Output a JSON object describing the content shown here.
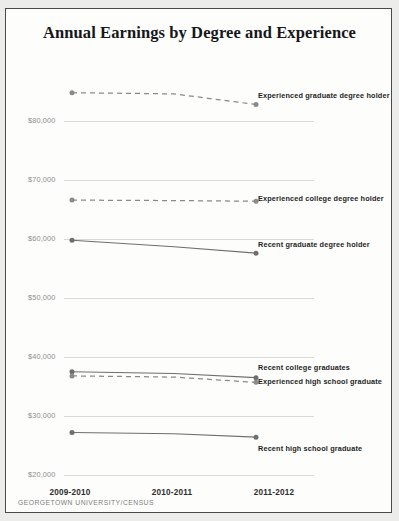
{
  "chart": {
    "title": "Annual Earnings by Degree and Experience",
    "source_note": "GEORGETOWN UNIVERSITY/CENSUS"
  },
  "chart_data": {
    "type": "line",
    "title": "Annual Earnings by Degree and Experience",
    "xlabel": "",
    "ylabel": "",
    "categories": [
      "2009-2010",
      "2010-2011",
      "2011-2012"
    ],
    "ylim": [
      20000,
      80000
    ],
    "yticks": [
      "$20,000",
      "$30,000",
      "$40,000",
      "$50,000",
      "$60,000",
      "$70,000",
      "$80,000"
    ],
    "ytick_values": [
      20000,
      30000,
      40000,
      50000,
      60000,
      70000,
      80000
    ],
    "grid": true,
    "legend_position": "right-inline",
    "series": [
      {
        "name": "Experienced graduate degree holder",
        "style": "dashed",
        "color": "#8a8a8a",
        "values": [
          84800,
          84600,
          82800
        ],
        "label_y": 86
      },
      {
        "name": "Experienced college degree holder",
        "style": "dashed",
        "color": "#8a8a8a",
        "values": [
          66600,
          66500,
          66400
        ],
        "label_y": 189
      },
      {
        "name": "Recent graduate degree holder",
        "style": "solid",
        "color": "#6e6e6e",
        "values": [
          59800,
          58700,
          57600
        ],
        "label_y": 235
      },
      {
        "name": "Recent college graduates",
        "style": "solid",
        "color": "#6e6e6e",
        "values": [
          37500,
          37200,
          36500
        ],
        "label_y": 358
      },
      {
        "name": "Experienced high school graduate",
        "style": "dashed",
        "color": "#8a8a8a",
        "values": [
          36800,
          36600,
          35700
        ],
        "label_y": 372
      },
      {
        "name": "Recent high school graduate",
        "style": "solid",
        "color": "#6e6e6e",
        "values": [
          27200,
          27000,
          26400
        ],
        "label_y": 439
      }
    ]
  }
}
